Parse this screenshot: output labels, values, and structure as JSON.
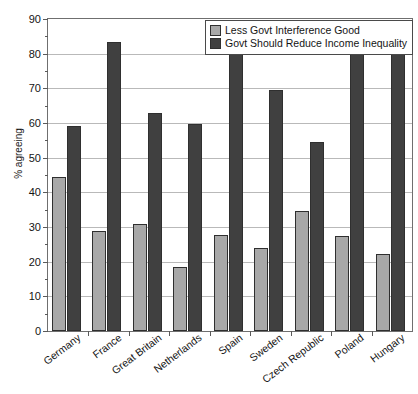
{
  "chart_data": {
    "type": "bar",
    "title": "",
    "xlabel": "",
    "ylabel": "% agreeing",
    "ylim": [
      0,
      90
    ],
    "ytick_step": 10,
    "yticks": [
      0,
      10,
      20,
      30,
      40,
      50,
      60,
      70,
      80,
      90
    ],
    "grid": true,
    "legend_position": "top-right",
    "categories": [
      "Germany",
      "France",
      "Great Britain",
      "Netherlands",
      "Spain",
      "Sweden",
      "Czech Republic",
      "Poland",
      "Hungary"
    ],
    "series": [
      {
        "name": "Less Govt Interference Good",
        "color": "#a8a8a8",
        "values": [
          44.5,
          28.8,
          31.0,
          18.5,
          27.8,
          24.0,
          34.5,
          27.5,
          22.2
        ]
      },
      {
        "name": "Govt Should Reduce Income Inequality",
        "color": "#404040",
        "values": [
          59.0,
          83.5,
          63.0,
          59.8,
          81.5,
          69.5,
          54.5,
          81.0,
          85.3
        ]
      }
    ]
  },
  "legend": {
    "items": [
      {
        "label": "Less Govt Interference Good",
        "color": "#a8a8a8"
      },
      {
        "label": "Govt Should Reduce Income Inequality",
        "color": "#404040"
      }
    ]
  },
  "axes": {
    "y_title": "% agreeing"
  }
}
